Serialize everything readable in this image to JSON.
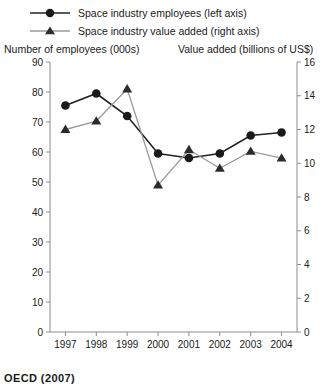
{
  "legend": {
    "items": [
      {
        "label": "Space industry employees (left axis)",
        "marker": "circle-marker-icon",
        "color": "#222222"
      },
      {
        "label": "Space industry value added (right axis)",
        "marker": "triangle-marker-icon",
        "color": "#9a9a9a"
      }
    ]
  },
  "left_axis_title": "Number of employees (000s)",
  "right_axis_title": "Value added (billions of US$)",
  "source_note": "OECD (2007)",
  "chart_data": {
    "type": "line",
    "title": "",
    "xlabel": "",
    "ylabel": "Number of employees (000s)",
    "y2label": "Value added (billions of US$)",
    "grid": false,
    "legend_position": "top-left",
    "categories": [
      "1997",
      "1998",
      "1999",
      "2000",
      "2001",
      "2002",
      "2003",
      "2004"
    ],
    "x_ticks": [
      "1997",
      "1998",
      "1999",
      "2000",
      "2001",
      "2002",
      "2003",
      "2004"
    ],
    "ylim": [
      0,
      90
    ],
    "y_ticks": [
      0,
      10,
      20,
      30,
      40,
      50,
      60,
      70,
      80,
      90
    ],
    "y2lim": [
      0,
      16
    ],
    "y2_ticks": [
      0,
      2,
      4,
      6,
      8,
      10,
      12,
      14,
      16
    ],
    "series": [
      {
        "name": "Space industry employees (left axis)",
        "axis": "left",
        "marker": "circle",
        "color": "#222222",
        "values": [
          75.5,
          79.5,
          72.0,
          59.5,
          58.0,
          59.5,
          65.5,
          66.5
        ]
      },
      {
        "name": "Space industry value added (right axis)",
        "axis": "right",
        "marker": "triangle",
        "color": "#9a9a9a",
        "values": [
          12.0,
          12.5,
          14.4,
          8.7,
          10.8,
          9.7,
          10.7,
          10.3
        ]
      }
    ]
  }
}
